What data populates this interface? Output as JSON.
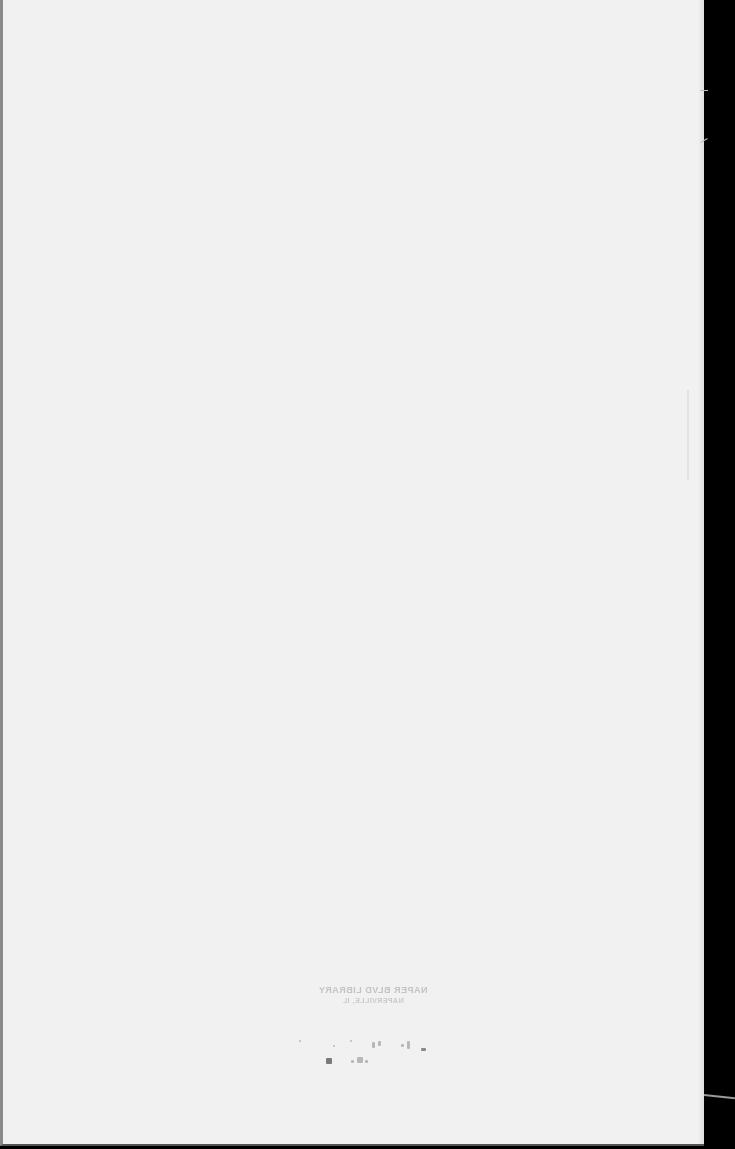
{
  "document": {
    "type": "scanned-blank-page",
    "page_color": "#f1f1f1",
    "background_color": "#000000"
  },
  "stamp": {
    "mirrored": true,
    "line1": "NAPER BLVD LIBRARY",
    "line2": "NAPERVILLE, IL"
  }
}
